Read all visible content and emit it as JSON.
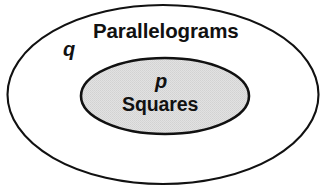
{
  "diagram": {
    "type": "euler-set-diagram",
    "outer_set": {
      "name": "Parallelograms",
      "variable": "q",
      "fill_color": "#ffffff",
      "stroke_color": "#111111"
    },
    "inner_set": {
      "name": "Squares",
      "variable": "p",
      "fill_color": "#dcdcdc",
      "stroke_color": "#111111"
    },
    "background_color": "#ffffff"
  }
}
